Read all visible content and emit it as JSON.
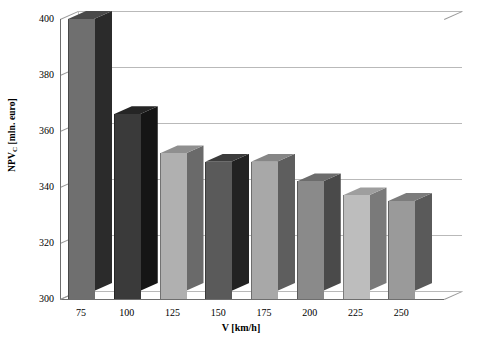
{
  "chart_data": {
    "type": "bar",
    "title": "",
    "subtitle": "",
    "xlabel": "V [km/h]",
    "ylabel_main": "NPV",
    "ylabel_sub": "C",
    "ylabel_units": " [mln. euro]",
    "ylabel_full": "NPVC [mln. euro]",
    "categories": [
      "75",
      "100",
      "125",
      "150",
      "175",
      "200",
      "225",
      "250"
    ],
    "values": [
      400,
      366,
      352,
      349,
      349,
      342,
      337,
      335
    ],
    "ylim": [
      300,
      400
    ],
    "yticks": [
      "300",
      "320",
      "340",
      "360",
      "380",
      "400"
    ],
    "ytick_values": [
      300,
      320,
      340,
      360,
      380,
      400
    ],
    "grid": true,
    "legend": "none",
    "projection": "3d-column",
    "bar_colors": [
      "#6f6f6f",
      "#3a3a3a",
      "#b0b0b0",
      "#5a5a5a",
      "#a8a8a8",
      "#8a8a8a",
      "#bdbdbd",
      "#9a9a9a"
    ],
    "bar_side_colors": [
      "#2b2b2b",
      "#151515",
      "#6a6a6a",
      "#222222",
      "#5e5e5e",
      "#4a4a4a",
      "#7a7a7a",
      "#5a5a5a"
    ],
    "bar_top_colors": [
      "#4a4a4a",
      "#252525",
      "#8f8f8f",
      "#3c3c3c",
      "#868686",
      "#6c6c6c",
      "#9e9e9e",
      "#7c7c7c"
    ],
    "plot_bgcolor": "#ffffff",
    "gridline_color": "#b9b9b9",
    "axis_color": "#6e6e6e"
  }
}
